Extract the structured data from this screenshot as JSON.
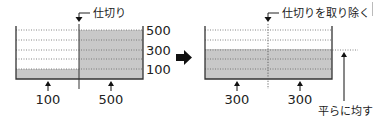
{
  "diagram": {
    "before": {
      "partition_label": "仕切り",
      "scale_labels": [
        "500",
        "300",
        "100"
      ],
      "left_level": "100",
      "right_level": "500"
    },
    "after": {
      "partition_label": "仕切りを取り除く",
      "left_level": "300",
      "right_level": "300",
      "leveling_label": "平らに均す"
    },
    "colors": {
      "fill": "#c8c8c8",
      "line": "#333333",
      "arrow": "#111111"
    }
  }
}
